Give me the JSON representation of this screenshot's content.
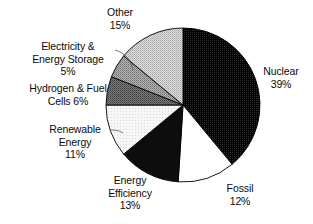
{
  "chart_data": {
    "type": "pie",
    "title": "",
    "subtitle": "",
    "xlabel": "",
    "ylabel": "",
    "legend_position": "none",
    "labels_position": "outside",
    "grid": false,
    "start_angle_deg": 0,
    "direction": "clockwise",
    "units": "%",
    "categories": [
      "Nuclear",
      "Fossil",
      "Energy Efficiency",
      "Renewable Energy",
      "Hydrogen & Fuel Cells",
      "Electricity & Energy Storage",
      "Other"
    ],
    "values": [
      39,
      12,
      13,
      11,
      6,
      5,
      15
    ],
    "total": 101,
    "slices": [
      {
        "name": "Nuclear",
        "value": 39,
        "value_text": "39%",
        "label_line1": "Nuclear",
        "label_line2": "39%",
        "fill": "#1a1a1a",
        "pattern": "dense-dither-dark",
        "start_deg": 0,
        "end_deg": 140.4
      },
      {
        "name": "Fossil",
        "value": 12,
        "value_text": "12%",
        "label_line1": "Fossil",
        "label_line2": "12%",
        "fill": "#ffffff",
        "pattern": "solid-white",
        "start_deg": 140.4,
        "end_deg": 183.6
      },
      {
        "name": "Energy Efficiency",
        "value": 13,
        "value_text": "13%",
        "label_line1": "Energy",
        "label_line2": "Efficiency",
        "label_line3": "13%",
        "fill": "#0d0d0d",
        "pattern": "solid-black",
        "start_deg": 183.6,
        "end_deg": 230.4
      },
      {
        "name": "Renewable Energy",
        "value": 11,
        "value_text": "11%",
        "label_line1": "Renewable",
        "label_line2": "Energy",
        "label_line3": "11%",
        "fill": "#f0f0f0",
        "pattern": "very-light-dither",
        "start_deg": 230.4,
        "end_deg": 270.0
      },
      {
        "name": "Hydrogen & Fuel Cells",
        "value": 6,
        "value_text": "6%",
        "label_line1": "Hydrogen & Fuel",
        "label_line2": "Cells 6%",
        "fill": "#6e6e6e",
        "pattern": "mid-dark-dither",
        "start_deg": 270.0,
        "end_deg": 291.6
      },
      {
        "name": "Electricity & Energy Storage",
        "value": 5,
        "value_text": "5%",
        "label_line1": "Electricity &",
        "label_line2": "Energy Storage",
        "label_line3": "5%",
        "fill": "#9a9a9a",
        "pattern": "mid-dither",
        "start_deg": 291.6,
        "end_deg": 309.6
      },
      {
        "name": "Other",
        "value": 15,
        "value_text": "15%",
        "label_line1": "Other",
        "label_line2": "15%",
        "fill": "#c8c8c8",
        "pattern": "light-dither",
        "start_deg": 309.6,
        "end_deg": 360.0
      }
    ]
  },
  "figure": {
    "background": "#ffffff",
    "outline_color": "#000000",
    "text_color": "#0a0a0a",
    "center_x": 183,
    "center_y": 105,
    "radius": 77
  }
}
